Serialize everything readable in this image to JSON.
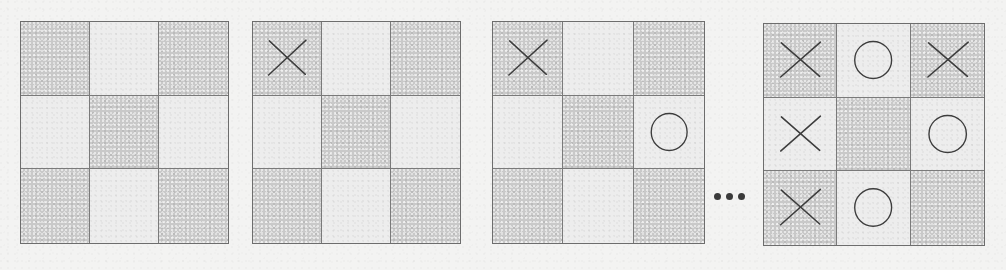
{
  "figure": {
    "caption": "",
    "kind": "tic-tac-toe-game-progression",
    "background_color": "#f3f3f2",
    "grid_line_color": "#7a7a7a",
    "mark_color": "#3d3d3d",
    "shade_dark_color": "#c9c9c9",
    "shade_light_color": "#ededed",
    "ellipsis": {
      "label": "...",
      "dot_count": 3,
      "x": 714,
      "y": 193
    },
    "boards": [
      {
        "name": "board-1",
        "state_label": "empty board",
        "x": 20,
        "y": 21,
        "width": 209,
        "height": 223,
        "shading": [
          [
            "dark",
            "light",
            "dark"
          ],
          [
            "light",
            "dark",
            "light"
          ],
          [
            "dark",
            "light",
            "dark"
          ]
        ],
        "cells": [
          [
            "",
            "",
            ""
          ],
          [
            "",
            "",
            ""
          ],
          [
            "",
            "",
            ""
          ]
        ]
      },
      {
        "name": "board-2",
        "state_label": "X at top-left",
        "x": 252,
        "y": 21,
        "width": 209,
        "height": 223,
        "shading": [
          [
            "dark",
            "light",
            "dark"
          ],
          [
            "light",
            "dark",
            "light"
          ],
          [
            "dark",
            "light",
            "dark"
          ]
        ],
        "cells": [
          [
            "X",
            "",
            ""
          ],
          [
            "",
            "",
            ""
          ],
          [
            "",
            "",
            ""
          ]
        ]
      },
      {
        "name": "board-3",
        "state_label": "X at top-left, O at middle-right",
        "x": 492,
        "y": 21,
        "width": 213,
        "height": 223,
        "shading": [
          [
            "dark",
            "light",
            "dark"
          ],
          [
            "light",
            "dark",
            "light"
          ],
          [
            "dark",
            "light",
            "dark"
          ]
        ],
        "cells": [
          [
            "X",
            "",
            ""
          ],
          [
            "",
            "",
            "O"
          ],
          [
            "",
            "",
            ""
          ]
        ]
      },
      {
        "name": "board-4",
        "state_label": "X wins on the left column",
        "x": 763,
        "y": 23,
        "width": 222,
        "height": 223,
        "shading": [
          [
            "dark",
            "light",
            "dark"
          ],
          [
            "light",
            "dark",
            "light"
          ],
          [
            "dark",
            "light",
            "dark"
          ]
        ],
        "cells": [
          [
            "X",
            "O",
            "X"
          ],
          [
            "X",
            "",
            "O"
          ],
          [
            "X",
            "O",
            ""
          ]
        ]
      }
    ]
  }
}
